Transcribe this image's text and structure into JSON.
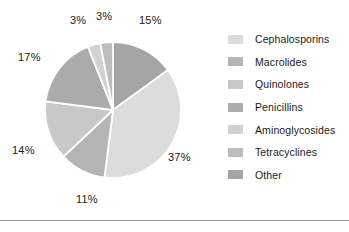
{
  "chart_data": {
    "type": "pie",
    "title": "",
    "labels": [
      "Cephalosporins",
      "Macrolides",
      "Quinolones",
      "Penicillins",
      "Aminoglycosides",
      "Tetracyclines",
      "Other"
    ],
    "values": [
      37,
      11,
      14,
      17,
      3,
      3,
      15
    ],
    "value_labels": [
      "37%",
      "11%",
      "14%",
      "17%",
      "3%",
      "3%",
      "15%"
    ],
    "colors": [
      "#dcdcdc",
      "#b4b4b4",
      "#c8c8c8",
      "#ababab",
      "#d2d2d2",
      "#bdbdbd",
      "#a5a5a5"
    ],
    "start_angle_deg": 0,
    "direction": "clockwise",
    "legend_position": "right",
    "grid": false,
    "slice_separator_color": "#ffffff",
    "background": "#ffffff"
  },
  "pie": {
    "callouts": [
      {
        "text": "15%",
        "left": 139,
        "top": 14
      },
      {
        "text": "37%",
        "left": 168,
        "top": 151
      },
      {
        "text": "11%",
        "left": 76,
        "top": 193
      },
      {
        "text": "14%",
        "left": 12,
        "top": 144
      },
      {
        "text": "17%",
        "left": 18,
        "top": 51
      },
      {
        "text": "3%",
        "left": 70,
        "top": 14
      },
      {
        "text": "3%",
        "left": 96,
        "top": 10
      }
    ]
  },
  "legend": {
    "entries": [
      {
        "label": "Cephalosporins",
        "color": "#dcdcdc"
      },
      {
        "label": "Macrolides",
        "color": "#b4b4b4"
      },
      {
        "label": "Quinolones",
        "color": "#c8c8c8"
      },
      {
        "label": "Penicillins",
        "color": "#ababab"
      },
      {
        "label": "Aminoglycosides",
        "color": "#d2d2d2"
      },
      {
        "label": "Tetracyclines",
        "color": "#bdbdbd"
      },
      {
        "label": "Other",
        "color": "#a5a5a5"
      }
    ]
  }
}
